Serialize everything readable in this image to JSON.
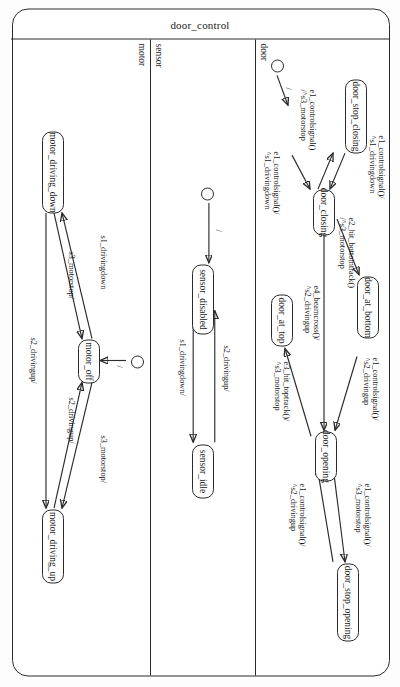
{
  "diagram": {
    "title": "door_control",
    "type": "uml-statechart",
    "orientation_deg": 90,
    "regions": [
      {
        "name": "door",
        "states": [
          {
            "id": "door_stop_closing",
            "label": "door_stop_closing"
          },
          {
            "id": "door_closing",
            "label": "door_closing"
          },
          {
            "id": "door_at_bottom",
            "label": "door_at_bottom"
          },
          {
            "id": "door_at_top",
            "label": "door_at_top"
          },
          {
            "id": "door_opening",
            "label": "door_opening"
          },
          {
            "id": "door_stop_opening",
            "label": "door_stop_opening"
          }
        ],
        "initial_label": "/",
        "transitions": [
          {
            "from": "initial",
            "to": "door_at_top",
            "label": "/"
          },
          {
            "from": "door_at_top",
            "to": "door_closing",
            "label_line1": "e1_controlsignal()/",
            "label_line2": "^s1_drivingdown"
          },
          {
            "from": "door_stop_closing",
            "to": "door_closing",
            "label_line1": "e1_controlsignal()/",
            "label_line2": "^s1_drivingdown"
          },
          {
            "from": "door_closing",
            "to": "door_stop_closing",
            "label_line1": "e1_controlsignal()/",
            "label_line2": "^s3_motorstop"
          },
          {
            "from": "door_closing",
            "to": "door_at_bottom",
            "label_line1": "e2_hit_bottomtrack()",
            "label_line2": "/^s3_motorstop"
          },
          {
            "from": "door_closing",
            "to": "door_opening",
            "label_line1": "e4_beamcross()/",
            "label_line2": "^s2_drivingup"
          },
          {
            "from": "door_at_bottom",
            "to": "door_opening",
            "label_line1": "e1_controlsignal()/",
            "label_line2": "^s2_drivingup"
          },
          {
            "from": "door_opening",
            "to": "door_stop_opening",
            "label_line1": "e1_controlsignal()/",
            "label_line2": "^s3_motorstop"
          },
          {
            "from": "door_stop_opening",
            "to": "door_opening",
            "label_line1": "e1_controlsignal()/",
            "label_line2": "^s2_drivingup"
          },
          {
            "from": "door_opening",
            "to": "door_at_top",
            "label_line1": "e3_hit_toptrack()/",
            "label_line2": "^s3_motorstop"
          }
        ]
      },
      {
        "name": "sensor",
        "states": [
          {
            "id": "sensor_disabled",
            "label": "sensor_disabled"
          },
          {
            "id": "sensor_idle",
            "label": "sensor_idle"
          }
        ],
        "initial_label": "/",
        "transitions": [
          {
            "from": "initial",
            "to": "sensor_disabled",
            "label": "/"
          },
          {
            "from": "sensor_disabled",
            "to": "sensor_idle",
            "label_line1": "s1_drivingdown/",
            "label_line2": ""
          },
          {
            "from": "sensor_idle",
            "to": "sensor_disabled",
            "label_line1": "s2_drivingup/",
            "label_line2": ""
          }
        ]
      },
      {
        "name": "motor",
        "states": [
          {
            "id": "motor_driving_down",
            "label": "motor_driving_down"
          },
          {
            "id": "motor_off",
            "label": "motor_off"
          },
          {
            "id": "motor_driving_up",
            "label": "motor_driving_up"
          }
        ],
        "initial_label": "/",
        "transitions": [
          {
            "from": "initial",
            "to": "motor_off",
            "label": "/"
          },
          {
            "from": "motor_driving_down",
            "to": "motor_driving_up",
            "label_line1": "s2_drivingup/",
            "label_line2": ""
          },
          {
            "from": "motor_driving_down",
            "to": "motor_off",
            "label_line1": "s3_motorstop/",
            "label_line2": ""
          },
          {
            "from": "motor_off",
            "to": "motor_driving_down",
            "label_line1": "s1_drivingdown",
            "label_line2": ""
          },
          {
            "from": "motor_off",
            "to": "motor_driving_up",
            "label_line1": "s2_drivingup/",
            "label_line2": ""
          },
          {
            "from": "motor_driving_up",
            "to": "motor_off",
            "label_line1": "s3_motorstop/",
            "label_line2": ""
          }
        ]
      }
    ]
  },
  "labels": {
    "slash": "/",
    "door_t1_a": "e1_controlsignal()/",
    "door_t1_b": "^s1_drivingdown",
    "door_t2_a": "e1_controlsignal()/",
    "door_t2_b": "^s1_drivingdown",
    "door_t3_a": "e1_controlsignal()",
    "door_t3_b": "/^s3_motorstop",
    "door_t4_a": "e2_hit_bottomtrack()",
    "door_t4_b": "/^s3_motorstop",
    "door_t5_a": "e4_beamcross()/",
    "door_t5_b": "^s2_drivingup",
    "door_t6_a": "e1_controlsignal()/",
    "door_t6_b": "^s2_drivingup",
    "door_t7_a": "e1_controlsignal()/",
    "door_t7_b": "^s3_motorstop",
    "door_t8_a": "e1_controlsignal()/",
    "door_t8_b": "^s2_drivingup",
    "door_t9_a": "e3_hit_toptrack()/",
    "door_t9_b": "^s3_motorstop",
    "sensor_t1": "s1_drivingdown/",
    "sensor_t2": "s2_drivingup/",
    "motor_t1": "s2_drivingup/",
    "motor_t2": "s3_motorstop/",
    "motor_t3": "s1_drivingdown",
    "motor_t4": "s2_drivingup/",
    "motor_t5": "s3_motorstop/"
  }
}
